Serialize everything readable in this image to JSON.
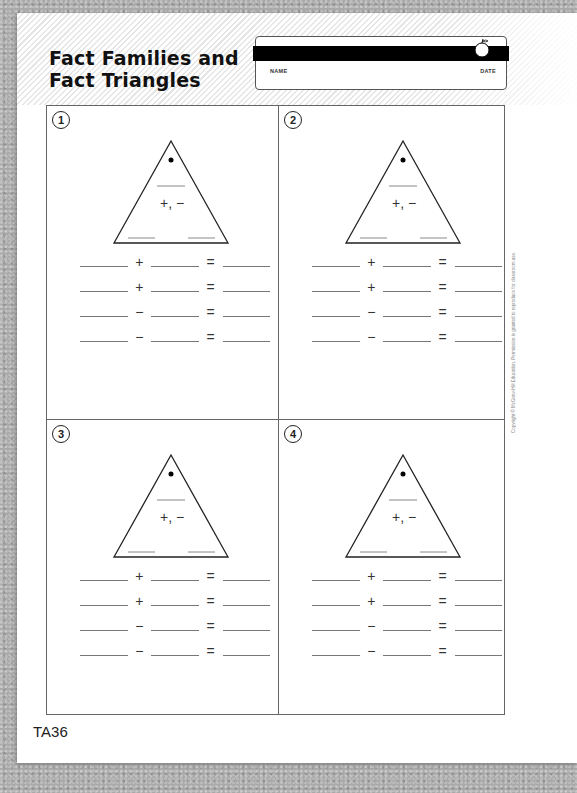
{
  "worksheet": {
    "title_line1": "Fact Families and",
    "title_line2": "Fact Triangles",
    "name_label": "NAME",
    "date_label": "DATE",
    "page_number": "TA36",
    "copyright": "Copyright © McGraw-Hill Education. Permission is granted to reproduce for classroom use."
  },
  "problems": [
    {
      "number": "1",
      "triangle_operators": "+, −",
      "equations": [
        {
          "op": "+",
          "eq": "="
        },
        {
          "op": "+",
          "eq": "="
        },
        {
          "op": "−",
          "eq": "="
        },
        {
          "op": "−",
          "eq": "="
        }
      ]
    },
    {
      "number": "2",
      "triangle_operators": "+, −",
      "equations": [
        {
          "op": "+",
          "eq": "="
        },
        {
          "op": "+",
          "eq": "="
        },
        {
          "op": "−",
          "eq": "="
        },
        {
          "op": "−",
          "eq": "="
        }
      ]
    },
    {
      "number": "3",
      "triangle_operators": "+, −",
      "equations": [
        {
          "op": "+",
          "eq": "="
        },
        {
          "op": "+",
          "eq": "="
        },
        {
          "op": "−",
          "eq": "="
        },
        {
          "op": "−",
          "eq": "="
        }
      ]
    },
    {
      "number": "4",
      "triangle_operators": "+, −",
      "equations": [
        {
          "op": "+",
          "eq": "="
        },
        {
          "op": "+",
          "eq": "="
        },
        {
          "op": "−",
          "eq": "="
        },
        {
          "op": "−",
          "eq": "="
        }
      ]
    }
  ]
}
